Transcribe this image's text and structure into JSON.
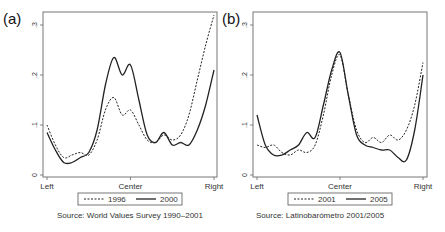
{
  "chart_data": [
    {
      "type": "line",
      "panel_label": "(a)",
      "title": "",
      "xlabel": "",
      "ylabel": "",
      "x_tick_labels": [
        "Left",
        "Center",
        "Right"
      ],
      "y_ticks": [
        0,
        0.1,
        0.2,
        0.3
      ],
      "y_tick_labels": [
        "0",
        ".1",
        ".2",
        ".3"
      ],
      "ylim": [
        0,
        0.32
      ],
      "grid": false,
      "legend_position": "bottom",
      "x": [
        0,
        0.05,
        0.1,
        0.15,
        0.2,
        0.25,
        0.3,
        0.35,
        0.4,
        0.45,
        0.5,
        0.55,
        0.6,
        0.65,
        0.7,
        0.75,
        0.8,
        0.85,
        0.9,
        0.95,
        1.0
      ],
      "series": [
        {
          "name": "1996",
          "style": "dashed",
          "values": [
            0.1,
            0.06,
            0.035,
            0.04,
            0.045,
            0.04,
            0.07,
            0.13,
            0.155,
            0.12,
            0.13,
            0.1,
            0.07,
            0.065,
            0.08,
            0.07,
            0.08,
            0.12,
            0.19,
            0.26,
            0.32
          ]
        },
        {
          "name": "2000",
          "style": "solid",
          "values": [
            0.085,
            0.05,
            0.025,
            0.025,
            0.035,
            0.045,
            0.09,
            0.18,
            0.235,
            0.2,
            0.22,
            0.15,
            0.08,
            0.065,
            0.085,
            0.06,
            0.065,
            0.06,
            0.09,
            0.14,
            0.21
          ]
        }
      ],
      "source": "Source: World Values Survey 1990–2001"
    },
    {
      "type": "line",
      "panel_label": "(b)",
      "title": "",
      "xlabel": "",
      "ylabel": "",
      "x_tick_labels": [
        "Left",
        "Center",
        "Right"
      ],
      "y_ticks": [
        0,
        0.1,
        0.2,
        0.3
      ],
      "y_tick_labels": [
        "0",
        ".1",
        ".2",
        ".3"
      ],
      "ylim": [
        0,
        0.32
      ],
      "grid": false,
      "legend_position": "bottom",
      "x": [
        0,
        0.05,
        0.1,
        0.15,
        0.2,
        0.25,
        0.3,
        0.35,
        0.4,
        0.45,
        0.5,
        0.55,
        0.6,
        0.65,
        0.7,
        0.75,
        0.8,
        0.85,
        0.9,
        0.95,
        1.0
      ],
      "series": [
        {
          "name": "2001",
          "style": "dashed",
          "values": [
            0.06,
            0.055,
            0.06,
            0.045,
            0.04,
            0.05,
            0.045,
            0.06,
            0.12,
            0.2,
            0.24,
            0.16,
            0.09,
            0.065,
            0.075,
            0.065,
            0.08,
            0.07,
            0.09,
            0.14,
            0.225
          ]
        },
        {
          "name": "2005",
          "style": "solid",
          "values": [
            0.12,
            0.06,
            0.04,
            0.04,
            0.05,
            0.06,
            0.085,
            0.075,
            0.14,
            0.21,
            0.245,
            0.16,
            0.08,
            0.06,
            0.055,
            0.05,
            0.05,
            0.035,
            0.03,
            0.09,
            0.2
          ]
        }
      ],
      "source": "Source: Latinobarómetro 2001/2005"
    }
  ]
}
